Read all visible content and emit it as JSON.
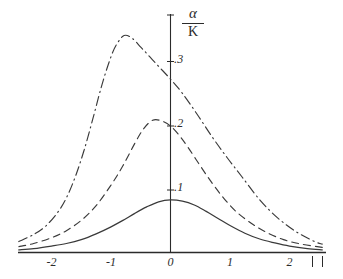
{
  "chart_data": {
    "type": "line",
    "title": "",
    "xlabel": "",
    "ylabel": "α / K",
    "ylabel_numerator": "α",
    "ylabel_denominator": "K",
    "xlim": [
      -2.55,
      2.6
    ],
    "ylim": [
      0,
      0.345
    ],
    "grid": false,
    "legend": "none",
    "x_ticks": [
      {
        "value": -2,
        "label": "-2"
      },
      {
        "value": -1,
        "label": "-1"
      },
      {
        "value": 0,
        "label": "0"
      },
      {
        "value": 1,
        "label": "1"
      },
      {
        "value": 2,
        "label": "2"
      }
    ],
    "y_ticks": [
      {
        "value": 0.1,
        "label": ".1"
      },
      {
        "value": 0.2,
        "label": ".2"
      },
      {
        "value": 0.3,
        "label": ".3"
      }
    ],
    "right_end_marks": [
      "|",
      "|"
    ],
    "series": [
      {
        "name": "curve-solid",
        "style": "solid",
        "peak_x": 0.0,
        "peak_y": 0.082,
        "x": [
          -2.55,
          -2.3,
          -2.0,
          -1.75,
          -1.5,
          -1.25,
          -1.0,
          -0.8,
          -0.6,
          -0.4,
          -0.2,
          0.0,
          0.2,
          0.4,
          0.6,
          0.8,
          1.0,
          1.25,
          1.5,
          1.75,
          2.0,
          2.3,
          2.55
        ],
        "y": [
          0.004,
          0.006,
          0.01,
          0.014,
          0.02,
          0.029,
          0.04,
          0.05,
          0.061,
          0.071,
          0.079,
          0.082,
          0.08,
          0.074,
          0.064,
          0.053,
          0.042,
          0.03,
          0.021,
          0.015,
          0.01,
          0.006,
          0.004
        ]
      },
      {
        "name": "curve-dashed",
        "style": "dashed",
        "peak_x": -0.3,
        "peak_y": 0.206,
        "x": [
          -2.55,
          -2.3,
          -2.0,
          -1.75,
          -1.5,
          -1.25,
          -1.0,
          -0.8,
          -0.6,
          -0.45,
          -0.3,
          -0.15,
          0.0,
          0.15,
          0.3,
          0.5,
          0.7,
          0.9,
          1.1,
          1.35,
          1.6,
          1.9,
          2.2,
          2.55
        ],
        "y": [
          0.009,
          0.014,
          0.023,
          0.034,
          0.05,
          0.073,
          0.105,
          0.135,
          0.17,
          0.193,
          0.206,
          0.205,
          0.197,
          0.182,
          0.163,
          0.135,
          0.108,
          0.084,
          0.064,
          0.046,
          0.032,
          0.02,
          0.013,
          0.008
        ]
      },
      {
        "name": "curve-dash-dot",
        "style": "dash-dot",
        "peak_x": -0.78,
        "peak_y": 0.338,
        "x": [
          -2.55,
          -2.3,
          -2.1,
          -1.9,
          -1.75,
          -1.6,
          -1.45,
          -1.3,
          -1.15,
          -1.0,
          -0.9,
          -0.78,
          -0.65,
          -0.5,
          -0.35,
          -0.2,
          0.0,
          0.2,
          0.45,
          0.7,
          0.95,
          1.2,
          1.5,
          1.8,
          2.1,
          2.4,
          2.55
        ],
        "y": [
          0.017,
          0.028,
          0.041,
          0.062,
          0.085,
          0.118,
          0.16,
          0.21,
          0.262,
          0.305,
          0.325,
          0.338,
          0.334,
          0.32,
          0.305,
          0.29,
          0.27,
          0.248,
          0.215,
          0.18,
          0.148,
          0.118,
          0.082,
          0.054,
          0.033,
          0.018,
          0.013
        ]
      }
    ]
  },
  "axes": {
    "x_axis_name": "horizontal-axis",
    "y_axis_name": "vertical-axis"
  }
}
